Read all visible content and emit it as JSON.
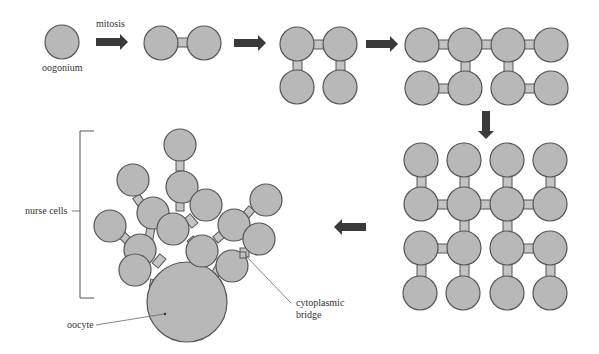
{
  "labels": {
    "mitosis": "mitosis",
    "oogonium": "oogonium",
    "nurse_cells": "nurse cells",
    "oocyte": "oocyte",
    "cytoplasmic": "cytoplasmic",
    "bridge": "bridge"
  },
  "colors": {
    "cell_fill": "#b8b8b8",
    "cell_stroke": "#555555",
    "bridge_fill": "#c4c4c4",
    "arrow": "#3a3a3a",
    "text": "#333333"
  },
  "stages": [
    {
      "name": "1 cell",
      "cells": 1
    },
    {
      "name": "2 cells",
      "cells": 2
    },
    {
      "name": "4 cells",
      "cells": 4
    },
    {
      "name": "8 cells",
      "cells": 8
    },
    {
      "name": "16 cells",
      "cells": 16
    },
    {
      "name": "cyst: 15 nurse cells + 1 oocyte",
      "cells": 16
    }
  ]
}
